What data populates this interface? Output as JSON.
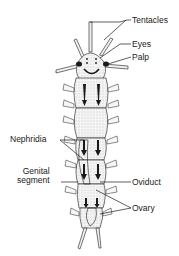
{
  "diagram": {
    "labels": {
      "tentacles": "Tentacles",
      "eyes": "Eyes",
      "palp": "Palp",
      "nephridia": "Nephridia",
      "genital_segment": "Genital\nsegment",
      "oviduct": "Oviduct",
      "ovary": "Ovary"
    },
    "colors": {
      "ink": "#1a1a1a",
      "body_fill": "#f2f2f2",
      "stipple": "#b0b0b0",
      "background": "#ffffff"
    }
  }
}
